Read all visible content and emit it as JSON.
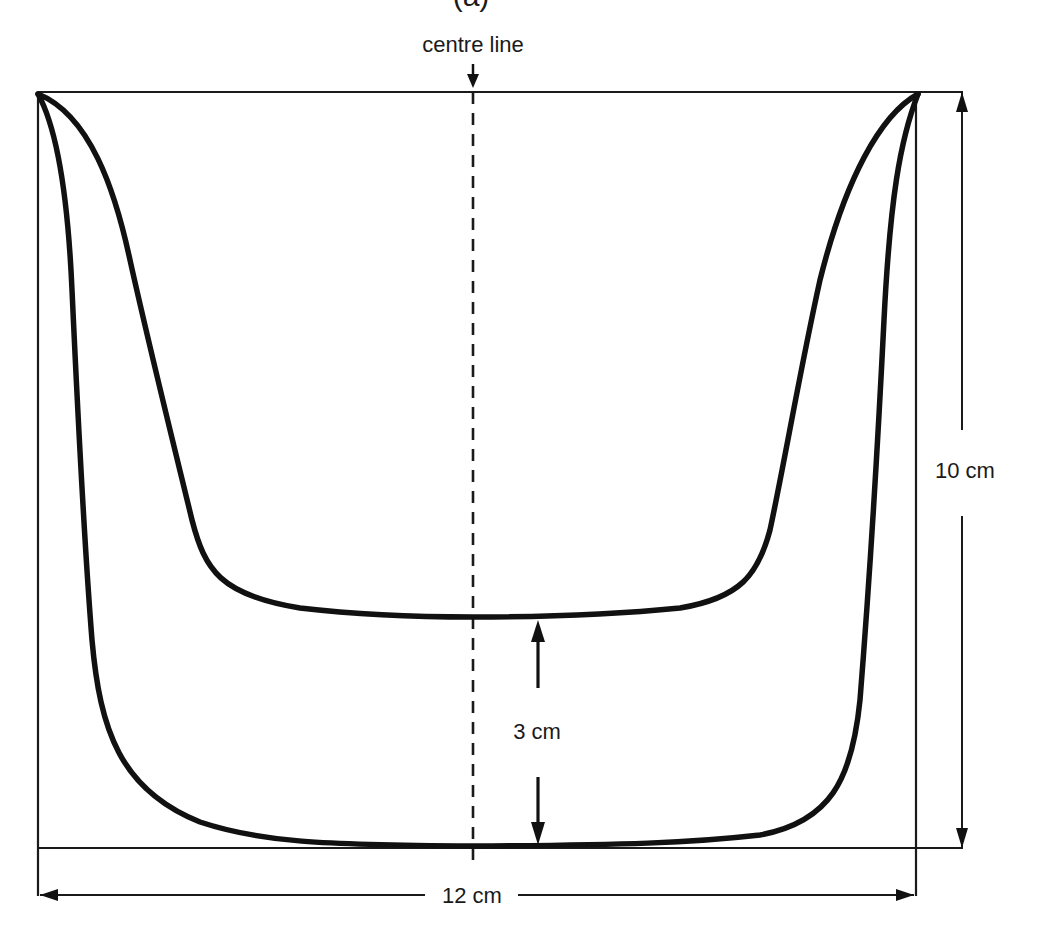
{
  "figure": {
    "partial_top_label": "(a)",
    "centre_line_label": "centre line",
    "dimensions": {
      "height_label": "10 cm",
      "width_label": "12 cm",
      "gap_label": "3 cm"
    },
    "shapes": [
      {
        "name": "outer-curve",
        "description": "Wide U-shaped curve with flat base touching the bottom of the box"
      },
      {
        "name": "inner-curve",
        "description": "Narrower U-shaped curve with flat base 3 cm above the outer curve's base"
      }
    ],
    "colors": {
      "line": "#111111",
      "background": "#ffffff"
    }
  }
}
